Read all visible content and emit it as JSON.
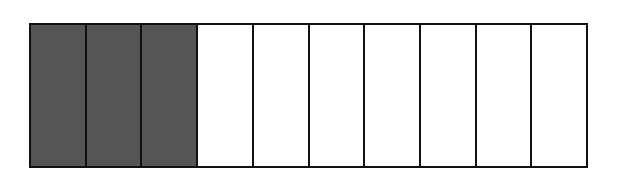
{
  "diagram": {
    "type": "fraction-bar",
    "total_parts": 10,
    "shaded_parts": 3,
    "fraction": "3/10",
    "colors": {
      "shaded": "#555555",
      "unshaded": "#ffffff",
      "outline": "#111111"
    }
  }
}
